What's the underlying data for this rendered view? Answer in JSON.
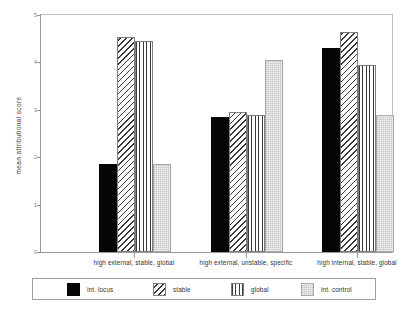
{
  "chart_data": {
    "type": "bar",
    "title": "",
    "xlabel": "",
    "ylabel": "mean attributional score",
    "ylim": [
      0,
      5
    ],
    "yticks": [
      0,
      1,
      2,
      3,
      4,
      5
    ],
    "ytick_labels": [
      "0",
      "1",
      "2",
      "3",
      "4",
      "5"
    ],
    "grid": false,
    "legend_position": "bottom",
    "categories": [
      "high external, stable, global",
      "high external, unstable, specific",
      "high internal, stable, global"
    ],
    "series": [
      {
        "name": "int. locus",
        "pattern": "solid-black",
        "values": [
          1.85,
          2.85,
          4.3
        ]
      },
      {
        "name": "stable",
        "pattern": "diagonal-hatch",
        "values": [
          4.54,
          2.95,
          4.65
        ]
      },
      {
        "name": "global",
        "pattern": "vertical-lines",
        "values": [
          4.45,
          2.9,
          3.95
        ]
      },
      {
        "name": "int. control",
        "pattern": "light-stipple",
        "values": [
          1.85,
          4.05,
          2.9
        ]
      }
    ]
  },
  "axes": {
    "y_title": "mean attributional score"
  },
  "legend": {
    "items": [
      {
        "label": "int. locus"
      },
      {
        "label": "stable"
      },
      {
        "label": "global"
      },
      {
        "label": "int. control"
      }
    ]
  }
}
